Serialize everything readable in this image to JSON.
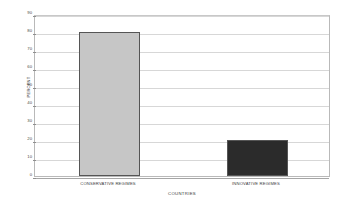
{
  "chart_data": {
    "type": "bar",
    "title": "",
    "subtitle": "",
    "categories": [
      "CONSERVATIVE REGIMES",
      "INNOVATIVE REGIMES"
    ],
    "values": [
      80,
      20
    ],
    "xlabel": "COUNTRIES",
    "ylabel": "PERCENT",
    "ylim": [
      0,
      90
    ],
    "ytick_labels": [
      "90",
      "80",
      "70",
      "60",
      "50",
      "40",
      "30",
      "20",
      "10",
      "0"
    ],
    "ytick_values": [
      90,
      80,
      70,
      60,
      50,
      40,
      30,
      20,
      10,
      0
    ],
    "grid": true,
    "legend": false,
    "legend_position": "none",
    "bar_colors": [
      "#c6c6c6",
      "#2b2b2b"
    ],
    "bar_border_color": "#555555",
    "gridline_color": "#d7d7d7",
    "axis_color": "#a6a6a6",
    "frame_color": "#b9b9b9",
    "background_color": "#ffffff"
  }
}
